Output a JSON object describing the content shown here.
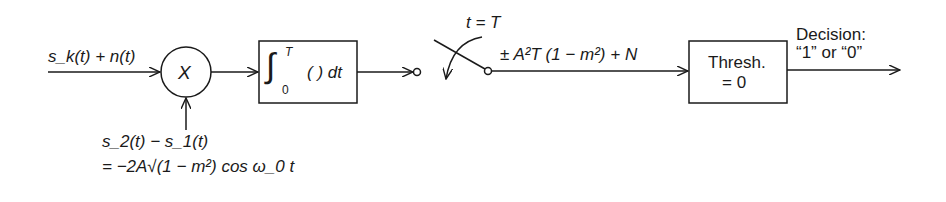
{
  "diagram": {
    "type": "block-diagram",
    "input": {
      "label": "s_k(t) + n(t)"
    },
    "multiplier": {
      "symbol": "X"
    },
    "reference": {
      "line1": "s_2(t) − s_1(t)",
      "line2": "= −2A√(1 − m²) cos ω_0 t"
    },
    "integrator": {
      "label": "∫_0^T ( ) dt",
      "upper": "T",
      "lower": "0",
      "body": "( ) dt"
    },
    "sampler": {
      "label": "t = T"
    },
    "sample_output": {
      "label": "± A²T (1 − m²) + N"
    },
    "threshold": {
      "line1": "Thresh.",
      "line2": "= 0"
    },
    "output": {
      "line1": "Decision:",
      "line2": "“1” or “0”"
    }
  }
}
